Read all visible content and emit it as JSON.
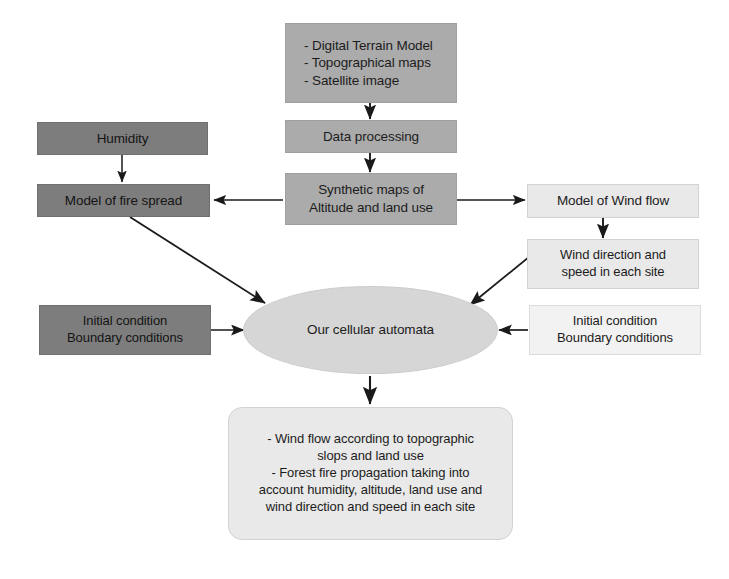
{
  "diagram": {
    "colors": {
      "dark_fill": "#7d7d7d",
      "mid_fill": "#ababab",
      "light_fill": "#e9e9e9",
      "pale_fill": "#f2f2f2",
      "ellipse_fill": "#d6d6d6",
      "edge": "#1a1a1a",
      "background": "#ffffff"
    },
    "nodes": [
      {
        "id": "inputs",
        "label": "- Digital Terrain Model\n- Topographical maps\n- Satellite image",
        "shape": "rect",
        "fill": "mid"
      },
      {
        "id": "data-processing",
        "label": "Data processing",
        "shape": "rect",
        "fill": "mid"
      },
      {
        "id": "synthetic-maps",
        "label": "Synthetic maps of\nAltitude and land use",
        "shape": "rect",
        "fill": "mid"
      },
      {
        "id": "humidity",
        "label": "Humidity",
        "shape": "rect",
        "fill": "dark"
      },
      {
        "id": "model-fire-spread",
        "label": "Model of fire spread",
        "shape": "rect",
        "fill": "dark"
      },
      {
        "id": "initial-condition-left",
        "label": "Initial condition\nBoundary conditions",
        "shape": "rect",
        "fill": "dark"
      },
      {
        "id": "model-wind-flow",
        "label": "Model of Wind flow",
        "shape": "rect",
        "fill": "light"
      },
      {
        "id": "wind-direction-speed",
        "label": "Wind direction and\nspeed in each site",
        "shape": "rect",
        "fill": "light"
      },
      {
        "id": "initial-condition-right",
        "label": "Initial condition\nBoundary conditions",
        "shape": "rect",
        "fill": "pale"
      },
      {
        "id": "cellular-automata",
        "label": "Our cellular automata",
        "shape": "ellipse",
        "fill": "ellipse"
      },
      {
        "id": "outputs",
        "label": "- Wind flow according to topographic\nslops and land use\n- Forest fire propagation taking into\naccount humidity, altitude, land use and\nwind direction and speed in each site",
        "shape": "rounded-rect",
        "fill": "light"
      }
    ],
    "edges": [
      {
        "from": "inputs",
        "to": "data-processing",
        "kind": "arrow-down"
      },
      {
        "from": "data-processing",
        "to": "synthetic-maps",
        "kind": "arrow-down"
      },
      {
        "from": "humidity",
        "to": "model-fire-spread",
        "kind": "arrow-down"
      },
      {
        "from": "synthetic-maps",
        "to": "model-fire-spread",
        "kind": "arrow-left"
      },
      {
        "from": "synthetic-maps",
        "to": "model-wind-flow",
        "kind": "arrow-right"
      },
      {
        "from": "model-wind-flow",
        "to": "wind-direction-speed",
        "kind": "arrow-down"
      },
      {
        "from": "model-fire-spread",
        "to": "cellular-automata",
        "kind": "arrow-diagonal"
      },
      {
        "from": "wind-direction-speed",
        "to": "cellular-automata",
        "kind": "arrow-diagonal"
      },
      {
        "from": "initial-condition-left",
        "to": "cellular-automata",
        "kind": "arrow-right"
      },
      {
        "from": "initial-condition-right",
        "to": "cellular-automata",
        "kind": "arrow-left"
      },
      {
        "from": "cellular-automata",
        "to": "outputs",
        "kind": "arrow-down"
      }
    ]
  }
}
